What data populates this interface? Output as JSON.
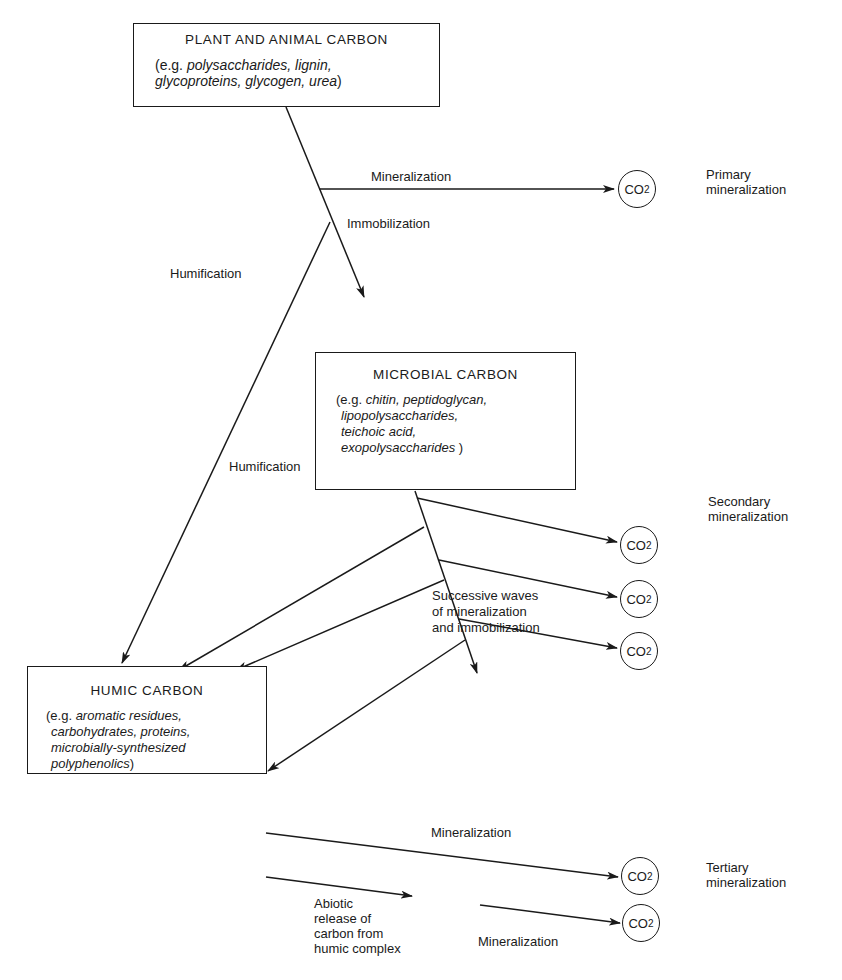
{
  "boxes": {
    "plant": {
      "title": "PLANT AND ANIMAL CARBON",
      "prefix": "(e.g.",
      "examples_line1": "polysaccharides, lignin,",
      "examples_line2": "glycoproteins, glycogen, urea",
      "suffix": ")"
    },
    "microbial": {
      "title": "MICROBIAL CARBON",
      "prefix": "(e.g.",
      "examples_line1": "chitin, peptidoglycan,",
      "examples_line2": "lipopolysaccharides,",
      "examples_line3": "teichoic acid,",
      "examples_line4": "exopolysaccharides",
      "suffix": ")"
    },
    "humic": {
      "title": "HUMIC CARBON",
      "prefix": "(e.g.",
      "examples_line1": "aromatic residues,",
      "examples_line2": "carbohydrates, proteins,",
      "examples_line3": "microbially-synthesized",
      "examples_line4": "polyphenolics",
      "suffix": ")"
    }
  },
  "co2": {
    "main": "CO",
    "sub": "2"
  },
  "labels": {
    "mineralization_primary": "Mineralization",
    "immobilization": "Immobilization",
    "humification_1": "Humification",
    "humification_2": "Humification",
    "successive_1": "Successive waves",
    "successive_2": "of mineralization",
    "successive_3": "and immobilization",
    "mineralization_tertiary": "Mineralization",
    "abiotic_1": "Abiotic",
    "abiotic_2": "release of",
    "abiotic_3": "carbon from",
    "abiotic_4": "humic complex",
    "mineralization_abiotic": "Mineralization"
  },
  "stages": {
    "primary_1": "Primary",
    "primary_2": "mineralization",
    "secondary_1": "Secondary",
    "secondary_2": "mineralization",
    "tertiary_1": "Tertiary",
    "tertiary_2": "mineralization"
  }
}
